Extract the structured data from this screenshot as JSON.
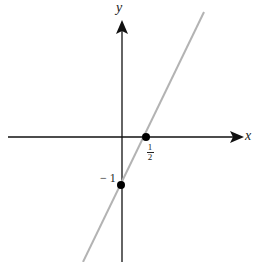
{
  "diagram": {
    "axes": {
      "x_label": "x",
      "y_label": "y"
    },
    "line": {
      "equation": "y = 2x - 1",
      "color": "#b3b3b3"
    },
    "points": [
      {
        "name": "x-intercept",
        "label_num": "1",
        "label_den": "2"
      },
      {
        "name": "y-intercept",
        "label": "− 1"
      }
    ],
    "colors": {
      "axis": "#111111",
      "point": "#000000"
    }
  }
}
